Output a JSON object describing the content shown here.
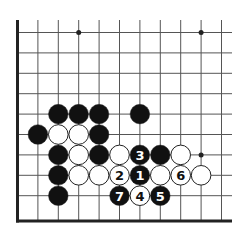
{
  "board": {
    "description": "Go problem diagram, lower-left corner region",
    "columns": 11,
    "rows": 10,
    "edges": {
      "left": true,
      "bottom": true,
      "top": false,
      "right": false
    },
    "colors": {
      "line": "#555555",
      "edge": "#222222",
      "black": "#111111",
      "white": "#ffffff",
      "background": "#ffffff"
    },
    "star_points": [
      {
        "col": 3,
        "row": 0
      },
      {
        "col": 9,
        "row": 0
      },
      {
        "col": 9,
        "row": 6
      }
    ],
    "stones": [
      {
        "col": 2,
        "row": 4,
        "color": "black"
      },
      {
        "col": 3,
        "row": 4,
        "color": "black"
      },
      {
        "col": 4,
        "row": 4,
        "color": "black"
      },
      {
        "col": 6,
        "row": 4,
        "color": "black"
      },
      {
        "col": 1,
        "row": 5,
        "color": "black"
      },
      {
        "col": 2,
        "row": 5,
        "color": "white"
      },
      {
        "col": 3,
        "row": 5,
        "color": "white"
      },
      {
        "col": 4,
        "row": 5,
        "color": "black"
      },
      {
        "col": 2,
        "row": 6,
        "color": "black"
      },
      {
        "col": 3,
        "row": 6,
        "color": "white"
      },
      {
        "col": 4,
        "row": 6,
        "color": "black"
      },
      {
        "col": 5,
        "row": 6,
        "color": "white"
      },
      {
        "col": 6,
        "row": 6,
        "color": "black",
        "label": "3"
      },
      {
        "col": 7,
        "row": 6,
        "color": "black"
      },
      {
        "col": 8,
        "row": 6,
        "color": "white"
      },
      {
        "col": 2,
        "row": 7,
        "color": "black"
      },
      {
        "col": 3,
        "row": 7,
        "color": "white"
      },
      {
        "col": 4,
        "row": 7,
        "color": "white"
      },
      {
        "col": 5,
        "row": 7,
        "color": "white",
        "label": "2"
      },
      {
        "col": 6,
        "row": 7,
        "color": "black",
        "label": "1"
      },
      {
        "col": 7,
        "row": 7,
        "color": "white"
      },
      {
        "col": 8,
        "row": 7,
        "color": "white",
        "label": "6"
      },
      {
        "col": 9,
        "row": 7,
        "color": "white"
      },
      {
        "col": 2,
        "row": 8,
        "color": "black"
      },
      {
        "col": 5,
        "row": 8,
        "color": "black",
        "label": "7"
      },
      {
        "col": 6,
        "row": 8,
        "color": "white",
        "label": "4"
      },
      {
        "col": 7,
        "row": 8,
        "color": "black",
        "label": "5"
      }
    ]
  }
}
